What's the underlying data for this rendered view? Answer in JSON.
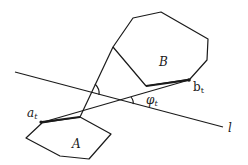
{
  "diagram": {
    "stroke_color": "#1a1a1a",
    "polygon_A": {
      "label": "A",
      "points": [
        [
          42,
          123
        ],
        [
          26,
          138
        ],
        [
          60,
          156
        ],
        [
          89,
          159
        ],
        [
          111,
          134
        ],
        [
          80,
          117
        ]
      ]
    },
    "polygon_B": {
      "label": "B",
      "points": [
        [
          113,
          47
        ],
        [
          133,
          18
        ],
        [
          161,
          12
        ],
        [
          208,
          39
        ],
        [
          207,
          60
        ],
        [
          190,
          79
        ],
        [
          146,
          86
        ]
      ]
    },
    "line_l": {
      "label": "l",
      "from": [
        15,
        72
      ],
      "to": [
        223,
        127
      ]
    },
    "supporting_lines": [
      {
        "name": "tangent-a-b",
        "from": [
          40,
          123
        ],
        "to": [
          189,
          80
        ]
      },
      {
        "name": "tangent-A-B",
        "from": [
          80,
          117
        ],
        "to": [
          113,
          47
        ]
      }
    ],
    "points": {
      "a_t": {
        "label": "a",
        "sub": "t",
        "at": [
          40,
          123
        ]
      },
      "b_t": {
        "label": "b",
        "sub": "t",
        "at": [
          189,
          80
        ]
      }
    },
    "angle": {
      "label": "φ",
      "sub": "t"
    }
  }
}
